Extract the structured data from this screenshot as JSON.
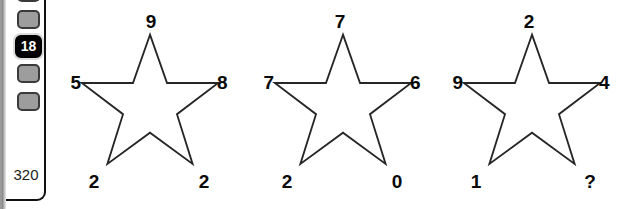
{
  "sidebar": {
    "nav_boxes": [
      {
        "name": "nav-box-1",
        "label": ""
      },
      {
        "name": "nav-box-2",
        "label": ""
      },
      {
        "name": "nav-box-4",
        "label": ""
      },
      {
        "name": "nav-box-5",
        "label": ""
      }
    ],
    "active_item": "18",
    "footer_value": "320"
  },
  "puzzle": {
    "stars": [
      {
        "name": "star-1",
        "top": "9",
        "left": "5",
        "right": "8",
        "bottom_left": "2",
        "bottom_right": "2"
      },
      {
        "name": "star-2",
        "top": "7",
        "left": "7",
        "right": "6",
        "bottom_left": "2",
        "bottom_right": "0"
      },
      {
        "name": "star-3",
        "top": "2",
        "left": "9",
        "right": "4",
        "bottom_left": "1",
        "bottom_right": "?"
      }
    ]
  },
  "colors": {
    "ink": "#0a0a0a",
    "star_stroke": "#262626",
    "star_fill": "#ffffff",
    "nav_box_fill": "#9d9d9d",
    "active_fill": "#000000",
    "active_text": "#ffffff",
    "background": "#ffffff"
  }
}
